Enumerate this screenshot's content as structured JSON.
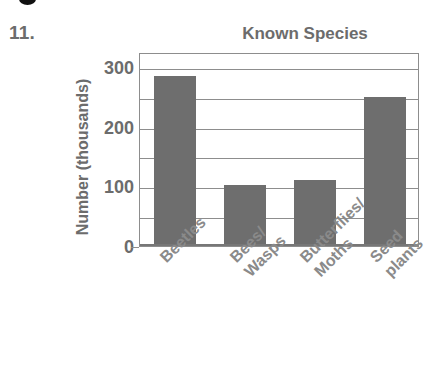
{
  "exercise": {
    "number_label": "11."
  },
  "artifact": {
    "dot_name": "scan-artifact-dot"
  },
  "chart_data": {
    "type": "bar",
    "title": "Known Species",
    "xlabel": "",
    "ylabel": "Number (thousands)",
    "categories": [
      "Beetles",
      "Bees/\nWasps",
      "Butterflies/\nMoths",
      "Seed\nplants"
    ],
    "category_lines": [
      [
        "Beetles"
      ],
      [
        "Bees/",
        "Wasps"
      ],
      [
        "Butterflies/",
        "Moths"
      ],
      [
        "Seed",
        "plants"
      ]
    ],
    "values": [
      285,
      102,
      110,
      250
    ],
    "ylim": [
      0,
      325
    ],
    "y_ticks_labeled": [
      0,
      100,
      200,
      300
    ],
    "y_tick_labels": [
      "0",
      "100",
      "200",
      "300"
    ],
    "y_gridlines": [
      50,
      100,
      150,
      200,
      250,
      300
    ],
    "grid": true,
    "legend": "none",
    "bar_color": "#6e6e6e",
    "axis_color": "#8d8d8d",
    "text_color": "#6c6c6c",
    "label_color": "#8a8a8a",
    "background": "#ffffff"
  }
}
